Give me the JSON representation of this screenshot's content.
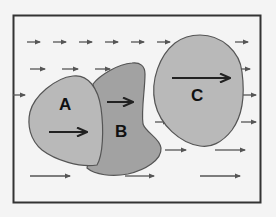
{
  "diagram": {
    "frame": {
      "x": 13,
      "y": 15,
      "width": 248,
      "height": 188,
      "stroke": "#333333",
      "background": "#f4f4f4"
    },
    "colors": {
      "shape_light": "#b9b9b9",
      "shape_dark": "#a2a2a2",
      "outline": "#555555",
      "arrow_flow": "#555555",
      "arrow_inside": "#222222"
    },
    "shapes": [
      {
        "id": "A",
        "label": "A",
        "fill": "#b9b9b9",
        "label_pos": [
          66,
          110
        ]
      },
      {
        "id": "B",
        "label": "B",
        "fill": "#a2a2a2",
        "label_pos": [
          122,
          137
        ]
      },
      {
        "id": "C",
        "label": "C",
        "fill": "#b9b9b9",
        "label_pos": [
          198,
          101
        ]
      }
    ],
    "flow_arrows": [
      {
        "x1": 27,
        "y1": 42,
        "x2": 40
      },
      {
        "x1": 53,
        "y1": 42,
        "x2": 66
      },
      {
        "x1": 79,
        "y1": 42,
        "x2": 92
      },
      {
        "x1": 105,
        "y1": 42,
        "x2": 118
      },
      {
        "x1": 131,
        "y1": 42,
        "x2": 144
      },
      {
        "x1": 157,
        "y1": 42,
        "x2": 170
      },
      {
        "x1": 235,
        "y1": 42,
        "x2": 248
      },
      {
        "x1": 30,
        "y1": 69,
        "x2": 45
      },
      {
        "x1": 62,
        "y1": 69,
        "x2": 78
      },
      {
        "x1": 95,
        "y1": 69,
        "x2": 110
      },
      {
        "x1": 128,
        "y1": 69,
        "x2": 143
      },
      {
        "x1": 240,
        "y1": 69,
        "x2": 250
      },
      {
        "x1": 13,
        "y1": 95,
        "x2": 25
      },
      {
        "x1": 242,
        "y1": 95,
        "x2": 256
      },
      {
        "x1": 155,
        "y1": 122,
        "x2": 168
      },
      {
        "x1": 241,
        "y1": 122,
        "x2": 256
      },
      {
        "x1": 165,
        "y1": 150,
        "x2": 186
      },
      {
        "x1": 215,
        "y1": 150,
        "x2": 245
      },
      {
        "x1": 30,
        "y1": 176,
        "x2": 70
      },
      {
        "x1": 125,
        "y1": 176,
        "x2": 154
      },
      {
        "x1": 200,
        "y1": 176,
        "x2": 240
      }
    ],
    "inner_arrows": [
      {
        "shape": "A",
        "x1": 49,
        "y1": 132,
        "x2": 87
      },
      {
        "shape": "B",
        "x1": 107,
        "y1": 102,
        "x2": 133
      },
      {
        "shape": "C",
        "x1": 172,
        "y1": 78,
        "x2": 230
      }
    ]
  }
}
